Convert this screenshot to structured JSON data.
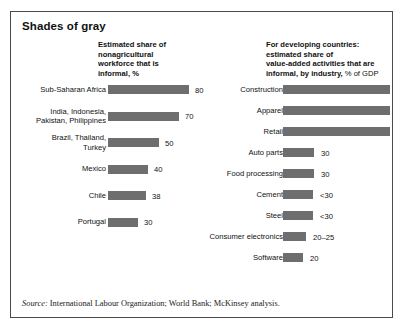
{
  "title": "Shades of gray",
  "source": {
    "label": "Source:",
    "text": " International Labour Organization; World Bank; McKinsey analysis."
  },
  "colors": {
    "bar": "#6e6e6e",
    "border": "#4a4a4a",
    "text": "#111111",
    "background": "#ffffff"
  },
  "chart_data": [
    {
      "type": "bar",
      "orientation": "horizontal",
      "title": "Estimated share of nonagricultural workforce that is informal, %",
      "title_lines": [
        "Estimated share of",
        "nonagricultural",
        "workforce that is",
        "informal, %"
      ],
      "xlabel": "",
      "ylabel": "",
      "xlim": [
        0,
        80
      ],
      "grid": false,
      "legend": "none",
      "categories": [
        "Sub-Saharan Africa",
        "India, Indonesia, Pakistan, Philippines",
        "Brazil, Thailand, Turkey",
        "Mexico",
        "Chile",
        "Portugal"
      ],
      "values": [
        80,
        70,
        50,
        40,
        38,
        30
      ],
      "value_labels": [
        "80",
        "70",
        "50",
        "40",
        "38",
        "30"
      ],
      "rows": [
        {
          "label_lines": [
            "Sub-Saharan Africa"
          ],
          "value": 80,
          "value_label": "80"
        },
        {
          "label_lines": [
            "India, Indonesia,",
            "Pakistan, Philippines"
          ],
          "value": 70,
          "value_label": "70"
        },
        {
          "label_lines": [
            "Brazil, Thailand,",
            "Turkey"
          ],
          "value": 50,
          "value_label": "50"
        },
        {
          "label_lines": [
            "Mexico"
          ],
          "value": 40,
          "value_label": "40"
        },
        {
          "label_lines": [
            "Chile"
          ],
          "value": 38,
          "value_label": "38"
        },
        {
          "label_lines": [
            "Portugal"
          ],
          "value": 30,
          "value_label": "30"
        }
      ]
    },
    {
      "type": "bar",
      "orientation": "horizontal",
      "title": "For developing countries: estimated share of value-added activities that are informal, by industry, % of GDP",
      "title_lines": [
        "For developing countries:",
        "estimated share of",
        "value-added activities that are",
        "informal, by industry,"
      ],
      "title_suffix": " % of GDP",
      "xlabel": "",
      "ylabel": "",
      "grid": false,
      "legend": "none",
      "categories": [
        "Construction",
        "Apparel",
        "Retail",
        "Auto parts",
        "Food processing",
        "Cement",
        "Steel",
        "Consumer electronics",
        "Software"
      ],
      "values": [
        105,
        105,
        105,
        30,
        30,
        29,
        29,
        23,
        20
      ],
      "value_labels": [
        "",
        "",
        "",
        "30",
        "30",
        "<30",
        "<30",
        "20–25",
        "20"
      ],
      "rows": [
        {
          "label_lines": [
            "Construction"
          ],
          "value": 105,
          "value_label": ""
        },
        {
          "label_lines": [
            "Apparel"
          ],
          "value": 105,
          "value_label": ""
        },
        {
          "label_lines": [
            "Retail"
          ],
          "value": 105,
          "value_label": ""
        },
        {
          "label_lines": [
            "Auto parts"
          ],
          "value": 30,
          "value_label": "30"
        },
        {
          "label_lines": [
            "Food processing"
          ],
          "value": 30,
          "value_label": "30"
        },
        {
          "label_lines": [
            "Cement"
          ],
          "value": 29,
          "value_label": "<30"
        },
        {
          "label_lines": [
            "Steel"
          ],
          "value": 29,
          "value_label": "<30"
        },
        {
          "label_lines": [
            "Consumer electronics"
          ],
          "value": 23,
          "value_label": "20–25"
        },
        {
          "label_lines": [
            "Software"
          ],
          "value": 20,
          "value_label": "20"
        }
      ]
    }
  ]
}
